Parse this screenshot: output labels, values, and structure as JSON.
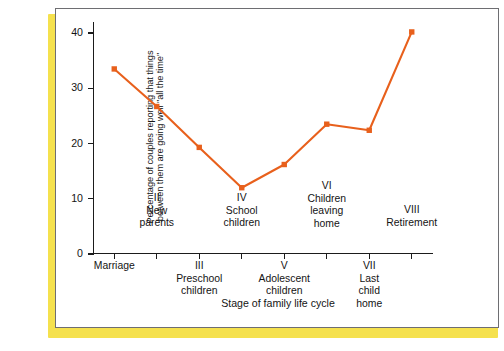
{
  "figure": {
    "frame_color": "#6e6e72",
    "shadow_color": "#f5e14e",
    "background": "#ffffff"
  },
  "chart_data": {
    "type": "line",
    "title": "",
    "xlabel": "Stage of family life cycle",
    "ylabel_lines": [
      "Percentage of couples reporting that things",
      "between them are going well \"all the time\""
    ],
    "ylabel": "Percentage of couples reporting that things between them are going well \"all the time\"",
    "categories": [
      "Marriage",
      "II New parents",
      "III Preschool children",
      "IV School children",
      "V Adolescent children",
      "VI Children leaving home",
      "VII Last child home",
      "VIII Retirement"
    ],
    "values": [
      33.5,
      26.7,
      19.3,
      12.0,
      16.2,
      23.5,
      22.4,
      40.2
    ],
    "ylim": [
      0,
      42
    ],
    "yticks": [
      0,
      10,
      20,
      30,
      40
    ],
    "ytick_labels": [
      "0",
      "10",
      "20",
      "30",
      "40"
    ],
    "grid": false,
    "legend": "none",
    "line_color": "#e8601c",
    "marker_color": "#e8601c",
    "marker_shape": "square"
  },
  "xaxis": {
    "title": "Stage of family life cycle",
    "tick_labels": [
      {
        "roman": "",
        "name": "Marriage",
        "lines": [
          "Marriage"
        ],
        "row": "lower"
      },
      {
        "roman": "II",
        "name": "New parents",
        "lines": [
          "II",
          "New",
          "parents"
        ],
        "row": "upper"
      },
      {
        "roman": "III",
        "name": "Preschool children",
        "lines": [
          "III",
          "Preschool",
          "children"
        ],
        "row": "lower"
      },
      {
        "roman": "IV",
        "name": "School children",
        "lines": [
          "IV",
          "School",
          "children"
        ],
        "row": "upper"
      },
      {
        "roman": "V",
        "name": "Adolescent children",
        "lines": [
          "V",
          "Adolescent",
          "children"
        ],
        "row": "lower"
      },
      {
        "roman": "VI",
        "name": "Children leaving home",
        "lines": [
          "VI",
          "Children",
          "leaving",
          "home"
        ],
        "row": "upper"
      },
      {
        "roman": "VII",
        "name": "Last child home",
        "lines": [
          "VII",
          "Last",
          "child",
          "home"
        ],
        "row": "lower"
      },
      {
        "roman": "VIII",
        "name": "Retirement",
        "lines": [
          "VIII",
          "Retirement"
        ],
        "row": "upper"
      }
    ]
  }
}
